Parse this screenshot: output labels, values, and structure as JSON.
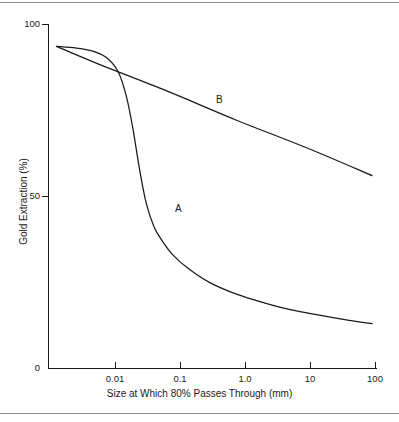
{
  "chart_data": {
    "type": "line",
    "title": "",
    "xlabel": "Size at Which 80% Passes Through (mm)",
    "ylabel": "Gold Extraction (%)",
    "xscale": "log",
    "xlim": [
      0.002,
      100
    ],
    "ylim": [
      0,
      100
    ],
    "xticks": [
      0.01,
      0.1,
      1.0,
      10,
      100
    ],
    "xticklabels": [
      "0.01",
      "0.1",
      "1.0",
      "10",
      "100"
    ],
    "yticks": [
      0,
      50,
      100
    ],
    "yticklabels": [
      "0",
      "50",
      "100"
    ],
    "grid": false,
    "legend": "inline-annotations",
    "annotations": [
      {
        "text": "A",
        "x": 0.13,
        "y": 47
      },
      {
        "text": "B",
        "x": 0.85,
        "y": 78
      }
    ],
    "series": [
      {
        "name": "A",
        "label": "A",
        "color": "#1a1a1a",
        "points": [
          {
            "x": 0.0026,
            "y": 93.5
          },
          {
            "x": 0.005,
            "y": 93.0
          },
          {
            "x": 0.009,
            "y": 92.0
          },
          {
            "x": 0.014,
            "y": 90.0
          },
          {
            "x": 0.02,
            "y": 86.0
          },
          {
            "x": 0.026,
            "y": 79.0
          },
          {
            "x": 0.032,
            "y": 70.0
          },
          {
            "x": 0.04,
            "y": 58.0
          },
          {
            "x": 0.05,
            "y": 48.0
          },
          {
            "x": 0.065,
            "y": 41.0
          },
          {
            "x": 0.085,
            "y": 37.0
          },
          {
            "x": 0.12,
            "y": 33.0
          },
          {
            "x": 0.2,
            "y": 29.0
          },
          {
            "x": 0.4,
            "y": 25.0
          },
          {
            "x": 1.0,
            "y": 21.5
          },
          {
            "x": 2.5,
            "y": 19.0
          },
          {
            "x": 6.0,
            "y": 17.0
          },
          {
            "x": 15.0,
            "y": 15.5
          },
          {
            "x": 40.0,
            "y": 14.0
          },
          {
            "x": 85.0,
            "y": 13.0
          }
        ]
      },
      {
        "name": "B",
        "label": "B",
        "color": "#1a1a1a",
        "points": [
          {
            "x": 0.0026,
            "y": 93.5
          },
          {
            "x": 0.01,
            "y": 88.5
          },
          {
            "x": 0.1,
            "y": 80.5
          },
          {
            "x": 1.0,
            "y": 72.0
          },
          {
            "x": 10.0,
            "y": 64.0
          },
          {
            "x": 85.0,
            "y": 56.0
          }
        ]
      }
    ]
  },
  "figure": {
    "x_axis_title": "Size at Which 80% Passes Through (mm)",
    "y_axis_title": "Gold Extraction (%)",
    "y_tick_100": "100",
    "y_tick_50": "50",
    "y_tick_0": "0",
    "x_tick_001": "0.01",
    "x_tick_01": "0.1",
    "x_tick_10": "1.0",
    "x_tick_100": "10",
    "x_tick_1000": "100",
    "label_a": "A",
    "label_b": "B"
  }
}
